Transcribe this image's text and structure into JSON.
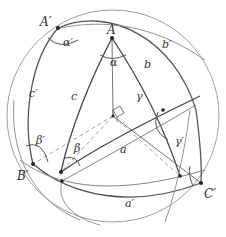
{
  "diagram": {
    "colors": {
      "sphere": "#999999",
      "arc": "#444444",
      "thin": "#777777",
      "dash": "#999999",
      "point": "#222222"
    },
    "vertices": {
      "A": "A",
      "A_prime": "A′",
      "B_prime": "B′",
      "C_prime": "C′"
    },
    "sides": {
      "a": "a",
      "b": "b",
      "c": "c",
      "a_prime": "a′",
      "b_prime": "b′",
      "c_prime": "c′"
    },
    "angles": {
      "alpha": "α",
      "beta": "β",
      "gamma": "γ",
      "alpha_prime": "α′",
      "beta_prime": "β′",
      "gamma_prime": "γ′"
    }
  }
}
